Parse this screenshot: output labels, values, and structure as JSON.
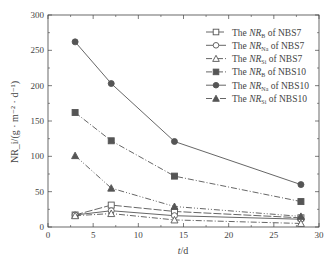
{
  "chart_data": {
    "type": "line",
    "title": "",
    "xlabel": "t/d",
    "ylabel": "NR_i/(g·m^-2·d^-1)",
    "xlim": [
      0,
      30
    ],
    "ylim": [
      0,
      300
    ],
    "xticks": [
      0,
      5,
      10,
      15,
      20,
      25,
      30
    ],
    "yticks": [
      0,
      50,
      100,
      150,
      200,
      250,
      300
    ],
    "grid": false,
    "legend_position": "upper right",
    "x": [
      3,
      7,
      14,
      28
    ],
    "series": [
      {
        "name": "The NR_B of NBS7",
        "label_pre": "The ",
        "label_nr": "NR",
        "label_sub": "B",
        "label_post": " of NBS7",
        "marker": "square-open",
        "dash": "8,2",
        "values": [
          17,
          31,
          22,
          13
        ]
      },
      {
        "name": "The NR_Na of NBS7",
        "label_pre": "The ",
        "label_nr": "NR",
        "label_sub": "Na",
        "label_post": " of NBS7",
        "marker": "circle-open",
        "dash": "",
        "values": [
          17,
          23,
          16,
          11
        ]
      },
      {
        "name": "The NR_Si of NBS7",
        "label_pre": "The ",
        "label_nr": "NR",
        "label_sub": "Si",
        "label_post": " of NBS7",
        "marker": "triangle-open",
        "dash": "6,2,1,2",
        "values": [
          16,
          19,
          10,
          5
        ]
      },
      {
        "name": "The NR_B of NBS10",
        "label_pre": "The ",
        "label_nr": "NR",
        "label_sub": "B",
        "label_post": " of NBS10",
        "marker": "square-filled",
        "dash": "6,2,1,2",
        "values": [
          162,
          122,
          72,
          36
        ]
      },
      {
        "name": "The NR_Na of NBS10",
        "label_pre": "The ",
        "label_nr": "NR",
        "label_sub": "Na",
        "label_post": " of NBS10",
        "marker": "circle-filled",
        "dash": "",
        "values": [
          262,
          203,
          121,
          60
        ]
      },
      {
        "name": "The NR_Si of NBS10",
        "label_pre": "The ",
        "label_nr": "NR",
        "label_sub": "Si",
        "label_post": " of NBS10",
        "marker": "triangle-filled",
        "dash": "6,2,1,2,1,2",
        "values": [
          101,
          55,
          29,
          15
        ]
      }
    ]
  },
  "axes": {
    "x_label_italic": "t",
    "x_label_rest": "/d",
    "y_label": "NR_i/(g · m⁻² · d⁻¹)"
  },
  "colors": {
    "line": "#555555",
    "axis": "#444444"
  }
}
